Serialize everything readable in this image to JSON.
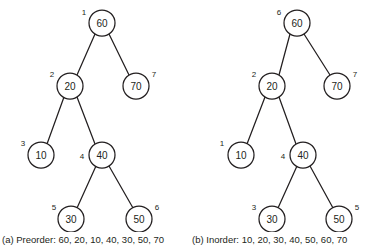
{
  "figure": {
    "background_color": "#ffffff",
    "stroke_color": "#231f20"
  },
  "panels": [
    {
      "id": "preorder",
      "caption": "(a) Preorder: 60, 20, 10, 40, 30, 50, 70",
      "traversal_name": "Preorder",
      "traversal_sequence": "60, 20, 10, 40, 30, 50, 70",
      "nodes": [
        {
          "value": "60",
          "order": "1",
          "cx": 102,
          "cy": 23,
          "r": 13,
          "label_x": 84,
          "label_y": 12
        },
        {
          "value": "20",
          "order": "2",
          "cx": 70,
          "cy": 86,
          "r": 13,
          "label_x": 52,
          "label_y": 74
        },
        {
          "value": "70",
          "order": "7",
          "cx": 136,
          "cy": 86,
          "r": 13,
          "label_x": 154,
          "label_y": 74
        },
        {
          "value": "10",
          "order": "3",
          "cx": 41,
          "cy": 155,
          "r": 13,
          "label_x": 23,
          "label_y": 143
        },
        {
          "value": "40",
          "order": "4",
          "cx": 102,
          "cy": 155,
          "r": 13,
          "label_x": 82,
          "label_y": 156
        },
        {
          "value": "30",
          "order": "5",
          "cx": 71,
          "cy": 219,
          "r": 13,
          "label_x": 54,
          "label_y": 207
        },
        {
          "value": "50",
          "order": "6",
          "cx": 139,
          "cy": 219,
          "r": 13,
          "label_x": 157,
          "label_y": 207
        }
      ],
      "edges": [
        {
          "x1": 95,
          "y1": 34,
          "x2": 77,
          "y2": 75
        },
        {
          "x1": 109,
          "y1": 34,
          "x2": 129,
          "y2": 75
        },
        {
          "x1": 64,
          "y1": 97,
          "x2": 47,
          "y2": 144
        },
        {
          "x1": 77,
          "y1": 97,
          "x2": 95,
          "y2": 144
        },
        {
          "x1": 96,
          "y1": 166,
          "x2": 77,
          "y2": 208
        },
        {
          "x1": 109,
          "y1": 166,
          "x2": 133,
          "y2": 208
        }
      ]
    },
    {
      "id": "inorder",
      "caption": "(b) Inorder: 10, 20, 30, 40, 50, 60, 70",
      "traversal_name": "Inorder",
      "traversal_sequence": "10, 20, 30, 40, 50, 60, 70",
      "nodes": [
        {
          "value": "60",
          "order": "6",
          "cx": 109,
          "cy": 23,
          "r": 13,
          "label_x": 91,
          "label_y": 12
        },
        {
          "value": "20",
          "order": "2",
          "cx": 84,
          "cy": 86,
          "r": 13,
          "label_x": 66,
          "label_y": 74
        },
        {
          "value": "70",
          "order": "7",
          "cx": 149,
          "cy": 86,
          "r": 13,
          "label_x": 167,
          "label_y": 74
        },
        {
          "value": "10",
          "order": "1",
          "cx": 53,
          "cy": 155,
          "r": 13,
          "label_x": 34,
          "label_y": 143
        },
        {
          "value": "40",
          "order": "4",
          "cx": 115,
          "cy": 155,
          "r": 13,
          "label_x": 95,
          "label_y": 156
        },
        {
          "value": "30",
          "order": "3",
          "cx": 84,
          "cy": 219,
          "r": 13,
          "label_x": 66,
          "label_y": 207
        },
        {
          "value": "50",
          "order": "5",
          "cx": 151,
          "cy": 219,
          "r": 13,
          "label_x": 169,
          "label_y": 207
        }
      ],
      "edges": [
        {
          "x1": 102,
          "y1": 34,
          "x2": 91,
          "y2": 75
        },
        {
          "x1": 116,
          "y1": 34,
          "x2": 142,
          "y2": 75
        },
        {
          "x1": 77,
          "y1": 97,
          "x2": 59,
          "y2": 144
        },
        {
          "x1": 91,
          "y1": 97,
          "x2": 108,
          "y2": 144
        },
        {
          "x1": 109,
          "y1": 166,
          "x2": 90,
          "y2": 208
        },
        {
          "x1": 122,
          "y1": 166,
          "x2": 145,
          "y2": 208
        }
      ]
    }
  ]
}
